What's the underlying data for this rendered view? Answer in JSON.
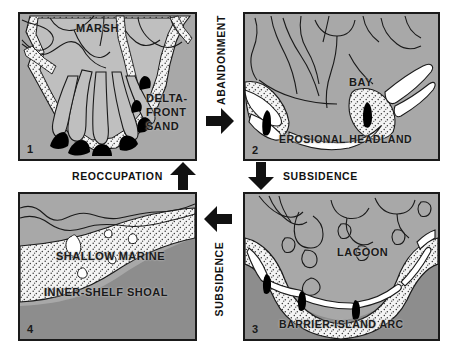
{
  "diagram": {
    "colors": {
      "land_gray": "#a8a8a8",
      "deep_water_gray": "#8a8a8a",
      "sand_stipple": "#f2f2f2",
      "outline": "#1a1a1a",
      "inlet_black": "#000000",
      "background": "#ffffff"
    }
  },
  "panels": [
    {
      "number": "1",
      "position": "top-left",
      "labels": [
        {
          "text": "MARSH",
          "name": "marsh-label"
        },
        {
          "text": "DELTA-",
          "name": "delta-front-sand-line1"
        },
        {
          "text": "FRONT",
          "name": "delta-front-sand-line2"
        },
        {
          "text": "SAND",
          "name": "delta-front-sand-line3"
        }
      ]
    },
    {
      "number": "2",
      "position": "top-right",
      "labels": [
        {
          "text": "BAY",
          "name": "bay-label"
        },
        {
          "text": "EROSIONAL HEADLAND",
          "name": "erosional-headland-label"
        }
      ]
    },
    {
      "number": "3",
      "position": "bottom-right",
      "labels": [
        {
          "text": "LAGOON",
          "name": "lagoon-label"
        },
        {
          "text": "BARRIER-ISLAND ARC",
          "name": "barrier-island-arc-label"
        }
      ]
    },
    {
      "number": "4",
      "position": "bottom-left",
      "labels": [
        {
          "text": "SHALLOW MARINE",
          "name": "shallow-marine-label"
        },
        {
          "text": "INNER-SHELF SHOAL",
          "name": "inner-shelf-shoal-label"
        }
      ]
    }
  ],
  "transitions": [
    {
      "label": "ABANDONMENT",
      "from": "1",
      "to": "2",
      "direction": "right",
      "orientation": "vertical-text"
    },
    {
      "label": "SUBSIDENCE",
      "from": "2",
      "to": "3",
      "direction": "down",
      "orientation": "horizontal-text"
    },
    {
      "label": "SUBSIDENCE",
      "from": "3",
      "to": "4",
      "direction": "left",
      "orientation": "vertical-text"
    },
    {
      "label": "REOCCUPATION",
      "from": "4",
      "to": "1",
      "direction": "up",
      "orientation": "horizontal-text"
    }
  ]
}
